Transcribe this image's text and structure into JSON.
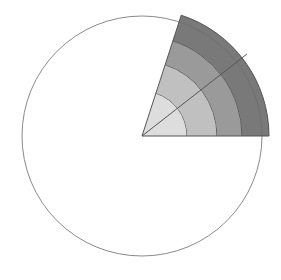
{
  "illustration": {
    "subject": "watercolor circle with shaded concentric wedge",
    "circle": {
      "cx": 142,
      "cy": 136,
      "r": 120,
      "stroke": "#8a8a8a"
    },
    "wedge": {
      "cx": 142,
      "cy": 136,
      "start_angle_deg": 0,
      "end_angle_deg": 72,
      "bands": [
        {
          "r_inner": 0,
          "r_outer": 45,
          "fill": "#d9d9d9"
        },
        {
          "r_inner": 45,
          "r_outer": 75,
          "fill": "#b9b9b9"
        },
        {
          "r_inner": 75,
          "r_outer": 100,
          "fill": "#8f8f8f"
        },
        {
          "r_inner": 100,
          "r_outer": 127,
          "fill": "#6a6a6a"
        }
      ],
      "divider_angle_deg": 38,
      "line_color": "#555555"
    }
  }
}
